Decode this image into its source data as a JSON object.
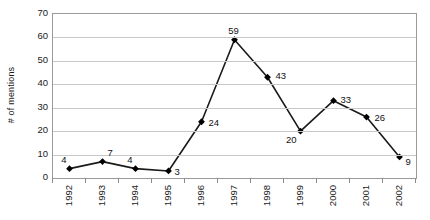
{
  "chart_data": {
    "type": "line",
    "title": "",
    "subtitle": "",
    "xlabel": "",
    "ylabel": "# of mentions",
    "categories": [
      "1992",
      "1993",
      "1994",
      "1995",
      "1996",
      "1997",
      "1998",
      "1999",
      "2000",
      "2001",
      "2002"
    ],
    "values": [
      4,
      7,
      4,
      3,
      24,
      59,
      43,
      20,
      33,
      26,
      9
    ],
    "point_labels": [
      "4",
      "7",
      "4",
      "3",
      "24",
      "59",
      "43",
      "20",
      "33",
      "26",
      "9"
    ],
    "series": [
      {
        "name": "# of mentions",
        "values": [
          4,
          7,
          4,
          3,
          24,
          59,
          43,
          20,
          33,
          26,
          9
        ],
        "marker": "diamond",
        "color": "#000000"
      }
    ],
    "ylim": [
      0,
      70
    ],
    "ytick_step": 10,
    "ytick_labels": [
      "70",
      "60",
      "50",
      "40",
      "30",
      "20",
      "10",
      "0"
    ],
    "ytick_values": [
      70,
      60,
      50,
      40,
      30,
      20,
      10,
      0
    ],
    "grid": true,
    "grid_axis": "y",
    "legend": false,
    "legend_position": "none",
    "data_labels_shown": true,
    "colors": {
      "line": "#1a1a1a",
      "marker": "#000000",
      "gridline": "#c8c8c8",
      "plot_border": "#9a9a9a",
      "background": "#ffffff",
      "text": "#1a1a1a"
    },
    "label_offsets": [
      {
        "dx": -2,
        "dy": -13,
        "align": "right"
      },
      {
        "dx": 6,
        "dy": -13,
        "align": "left"
      },
      {
        "dx": -2,
        "dy": -13,
        "align": "right"
      },
      {
        "dx": 7,
        "dy": -3,
        "align": "left"
      },
      {
        "dx": 8,
        "dy": -3,
        "align": "left"
      },
      {
        "dx": 0,
        "dy": -13,
        "align": "center"
      },
      {
        "dx": 9,
        "dy": -5,
        "align": "left"
      },
      {
        "dx": -3,
        "dy": 5,
        "align": "right"
      },
      {
        "dx": 8,
        "dy": -5,
        "align": "left"
      },
      {
        "dx": 9,
        "dy": -3,
        "align": "left"
      },
      {
        "dx": 7,
        "dy": 1,
        "align": "left"
      }
    ]
  }
}
